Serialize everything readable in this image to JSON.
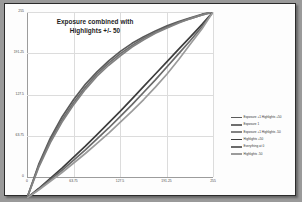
{
  "chart": {
    "title_line1": "Exposure combined with",
    "title_line2": "Highlights +/- 50"
  },
  "chart_data": {
    "type": "line",
    "title": "Exposure combined with Highlights +/- 50",
    "xlabel": "",
    "ylabel": "",
    "xlim": [
      0,
      255
    ],
    "ylim": [
      0,
      255
    ],
    "xticks": [
      0,
      63.75,
      127.5,
      191.25,
      255
    ],
    "xtick_labels": [
      "0",
      "63.75",
      "127.5",
      "191.25",
      "255"
    ],
    "yticks": [
      0,
      63.75,
      127.5,
      191.25,
      255
    ],
    "ytick_labels": [
      "0",
      "63.75",
      "127.5",
      "191.25",
      "255"
    ],
    "grid": true,
    "legend_position": "right",
    "x": [
      0,
      16,
      32,
      48,
      64,
      80,
      96,
      112,
      128,
      144,
      160,
      176,
      192,
      208,
      224,
      240,
      255
    ],
    "series": [
      {
        "name": "Exposure +1 Highlights +50",
        "color": "#5a5a5a",
        "values": [
          0,
          46,
          82,
          111,
          135,
          156,
          173,
          188,
          201,
          212,
          221,
          229,
          236,
          242,
          247,
          252,
          255
        ]
      },
      {
        "name": "Exposure 1",
        "color": "#6e6e6e",
        "values": [
          0,
          44,
          79,
          107,
          131,
          152,
          170,
          185,
          198,
          209,
          219,
          227,
          234,
          241,
          246,
          251,
          255
        ]
      },
      {
        "name": "Exposure +1 Highlights -50",
        "color": "#828282",
        "values": [
          0,
          42,
          76,
          104,
          128,
          149,
          167,
          182,
          195,
          207,
          217,
          226,
          233,
          240,
          246,
          251,
          255
        ]
      },
      {
        "name": "Highlights +50",
        "color": "#3d3d3d",
        "values": [
          0,
          13,
          27,
          41,
          56,
          71,
          87,
          103,
          119,
          136,
          153,
          170,
          187,
          204,
          221,
          238,
          255
        ]
      },
      {
        "name": "Everything at 0",
        "color": "#6a6a6a",
        "values": [
          0,
          12,
          25,
          38,
          52,
          66,
          81,
          96,
          112,
          128,
          145,
          162,
          180,
          198,
          216,
          235,
          255
        ]
      },
      {
        "name": "Highlights -50",
        "color": "#9b9b9b",
        "values": [
          0,
          11,
          23,
          35,
          48,
          61,
          75,
          89,
          104,
          119,
          135,
          152,
          170,
          190,
          211,
          232,
          255
        ]
      }
    ]
  }
}
